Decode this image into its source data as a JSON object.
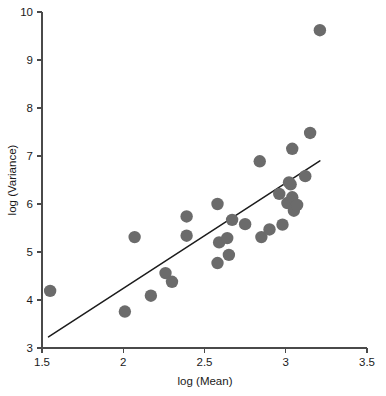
{
  "chart_data": {
    "type": "scatter",
    "title": "",
    "xlabel": "log (Mean)",
    "ylabel": "log (Variance)",
    "xlim": [
      1.5,
      3.5
    ],
    "ylim": [
      3,
      10
    ],
    "xticks": [
      "1.5",
      "2",
      "2.5",
      "3",
      "3.5"
    ],
    "xtick_values": [
      1.5,
      2,
      2.5,
      3,
      3.5
    ],
    "yticks": [
      "3",
      "4",
      "5",
      "6",
      "7",
      "8",
      "9",
      "10"
    ],
    "ytick_values": [
      3,
      4,
      5,
      6,
      7,
      8,
      9,
      10
    ],
    "grid": false,
    "legend": false,
    "marker_color": "#6b6b6b",
    "marker_size": 6.2,
    "line_color": "#1c1c1c",
    "points": [
      {
        "x": 1.55,
        "y": 4.19
      },
      {
        "x": 2.01,
        "y": 3.76
      },
      {
        "x": 2.07,
        "y": 5.31
      },
      {
        "x": 2.17,
        "y": 4.09
      },
      {
        "x": 2.26,
        "y": 4.56
      },
      {
        "x": 2.3,
        "y": 4.38
      },
      {
        "x": 2.39,
        "y": 5.74
      },
      {
        "x": 2.39,
        "y": 5.34
      },
      {
        "x": 2.58,
        "y": 6.0
      },
      {
        "x": 2.59,
        "y": 5.2
      },
      {
        "x": 2.58,
        "y": 4.77
      },
      {
        "x": 2.64,
        "y": 5.29
      },
      {
        "x": 2.65,
        "y": 4.94
      },
      {
        "x": 2.67,
        "y": 5.67
      },
      {
        "x": 2.75,
        "y": 5.58
      },
      {
        "x": 2.84,
        "y": 6.89
      },
      {
        "x": 2.85,
        "y": 5.31
      },
      {
        "x": 2.9,
        "y": 5.47
      },
      {
        "x": 2.96,
        "y": 6.21
      },
      {
        "x": 2.98,
        "y": 5.57
      },
      {
        "x": 3.01,
        "y": 6.02
      },
      {
        "x": 3.02,
        "y": 6.45
      },
      {
        "x": 3.03,
        "y": 6.41
      },
      {
        "x": 3.04,
        "y": 6.14
      },
      {
        "x": 3.04,
        "y": 7.15
      },
      {
        "x": 3.05,
        "y": 5.86
      },
      {
        "x": 3.07,
        "y": 5.98
      },
      {
        "x": 3.12,
        "y": 6.58
      },
      {
        "x": 3.15,
        "y": 7.48
      },
      {
        "x": 3.21,
        "y": 9.62
      }
    ],
    "fit_line": {
      "x0": 1.54,
      "y0": 3.23,
      "x1": 3.21,
      "y1": 6.9
    }
  }
}
